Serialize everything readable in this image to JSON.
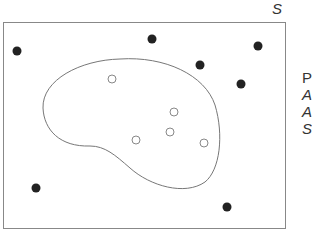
{
  "diagram": {
    "set_label": "S",
    "side_text_lines": [
      {
        "text": "P",
        "italic": false
      },
      {
        "text": "A",
        "italic": true
      },
      {
        "text": "A",
        "italic": true
      },
      {
        "text": "S",
        "italic": true
      }
    ],
    "colors": {
      "border": "#888888",
      "curve": "#777777",
      "filled_point": "#222222",
      "hollow_point_stroke": "#888888"
    },
    "filled_points": [
      {
        "x": 17,
        "y": 51
      },
      {
        "x": 152,
        "y": 39
      },
      {
        "x": 258,
        "y": 46
      },
      {
        "x": 200,
        "y": 65
      },
      {
        "x": 241,
        "y": 84
      },
      {
        "x": 36,
        "y": 188
      },
      {
        "x": 227,
        "y": 207
      }
    ],
    "hollow_points": [
      {
        "x": 112,
        "y": 79
      },
      {
        "x": 174,
        "y": 112
      },
      {
        "x": 170,
        "y": 132
      },
      {
        "x": 136,
        "y": 140
      },
      {
        "x": 204,
        "y": 143
      }
    ]
  }
}
